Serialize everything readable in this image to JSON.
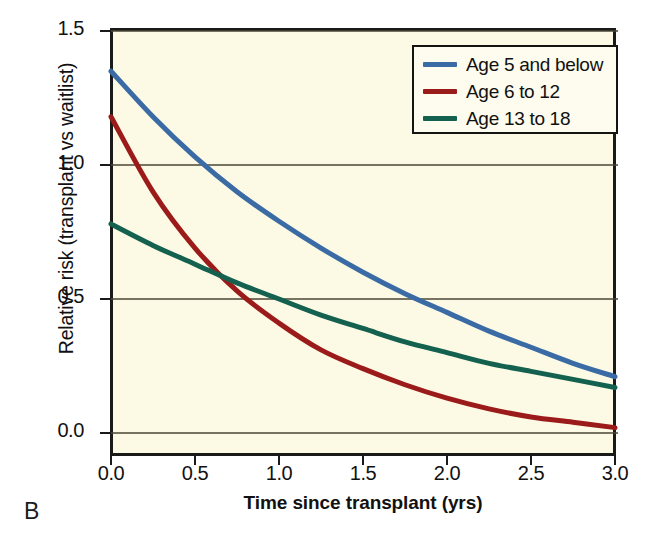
{
  "panel": {
    "label": "B"
  },
  "chart_data": {
    "type": "line",
    "title": "",
    "xlabel": "Time since transplant (yrs)",
    "ylabel": "Relative risk (transplant vs waitlist)",
    "xlim": [
      0.0,
      3.0
    ],
    "ylim": [
      0.0,
      1.5
    ],
    "xticks": [
      "0.0",
      "0.5",
      "1.0",
      "1.5",
      "2.0",
      "2.5",
      "3.0"
    ],
    "xtick_values": [
      0.0,
      0.5,
      1.0,
      1.5,
      2.0,
      2.5,
      3.0
    ],
    "yticks": [
      "0.0",
      "0.5",
      "1.0",
      "1.5"
    ],
    "ytick_values": [
      0.0,
      0.5,
      1.0,
      1.5
    ],
    "grid": "horizontal",
    "legend_position": "top-right",
    "background_color": "#fcfae4",
    "x": [
      0.0,
      0.25,
      0.5,
      0.75,
      1.0,
      1.25,
      1.5,
      1.75,
      2.0,
      2.25,
      2.5,
      2.75,
      3.0
    ],
    "series": [
      {
        "name": "Age 5 and below",
        "color": "#3a6ba5",
        "values": [
          1.35,
          1.18,
          1.03,
          0.9,
          0.79,
          0.69,
          0.6,
          0.52,
          0.45,
          0.38,
          0.32,
          0.26,
          0.21
        ]
      },
      {
        "name": "Age 6 to 12",
        "color": "#9b1b1b",
        "values": [
          1.18,
          0.9,
          0.69,
          0.53,
          0.41,
          0.31,
          0.24,
          0.18,
          0.13,
          0.09,
          0.06,
          0.04,
          0.02
        ]
      },
      {
        "name": "Age 13 to 18",
        "color": "#14614f",
        "values": [
          0.78,
          0.7,
          0.63,
          0.56,
          0.5,
          0.44,
          0.39,
          0.34,
          0.3,
          0.26,
          0.23,
          0.2,
          0.17
        ]
      }
    ],
    "annotations": []
  }
}
